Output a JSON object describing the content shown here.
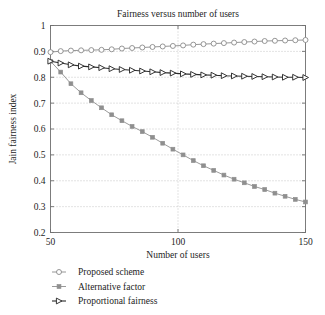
{
  "chart_data": {
    "type": "line",
    "title": "Fairness versus number of users",
    "xlabel": "Number of users",
    "ylabel": "Jain fairness index",
    "xlim": [
      50,
      150
    ],
    "ylim": [
      0.2,
      1
    ],
    "xticks": [
      50,
      100,
      150
    ],
    "xticklabels": [
      "50",
      "100",
      "150"
    ],
    "yticks": [
      0.2,
      0.3,
      0.4,
      0.5,
      0.6,
      0.7,
      0.8,
      0.9,
      1
    ],
    "yticklabels": [
      "0.2",
      "0.3",
      "0.4",
      "0.5",
      "0.6",
      "0.7",
      "0.8",
      "0.9",
      "1"
    ],
    "grid": "dotted",
    "legend_position": "below-left",
    "x": [
      50,
      54,
      58,
      62,
      66,
      70,
      74,
      78,
      82,
      86,
      90,
      94,
      98,
      102,
      106,
      110,
      114,
      118,
      122,
      126,
      130,
      134,
      138,
      142,
      146,
      150
    ],
    "series": [
      {
        "name": "Proposed scheme",
        "marker": "circle-open",
        "color": "#8a8a8a",
        "values": [
          0.897,
          0.901,
          0.903,
          0.904,
          0.905,
          0.906,
          0.908,
          0.911,
          0.913,
          0.915,
          0.917,
          0.919,
          0.921,
          0.923,
          0.926,
          0.928,
          0.93,
          0.932,
          0.934,
          0.936,
          0.938,
          0.94,
          0.941,
          0.942,
          0.943,
          0.944
        ]
      },
      {
        "name": "Alternative factor",
        "marker": "square-filled",
        "color": "#8f8f8f",
        "values": [
          0.862,
          0.82,
          0.775,
          0.74,
          0.71,
          0.682,
          0.655,
          0.632,
          0.61,
          0.59,
          0.568,
          0.545,
          0.522,
          0.5,
          0.478,
          0.458,
          0.44,
          0.422,
          0.406,
          0.392,
          0.378,
          0.366,
          0.352,
          0.34,
          0.328,
          0.318
        ]
      },
      {
        "name": "Proportional fairness",
        "marker": "triangle-right",
        "color": "#2b2b2b",
        "values": [
          0.862,
          0.855,
          0.848,
          0.843,
          0.84,
          0.837,
          0.833,
          0.83,
          0.827,
          0.824,
          0.821,
          0.818,
          0.816,
          0.813,
          0.811,
          0.809,
          0.808,
          0.806,
          0.805,
          0.804,
          0.803,
          0.802,
          0.801,
          0.8,
          0.8,
          0.799
        ]
      }
    ]
  },
  "legend": {
    "items": [
      {
        "label": "Proposed scheme"
      },
      {
        "label": "Alternative factor"
      },
      {
        "label": "Proportional fairness"
      }
    ]
  },
  "colors": {
    "axis": "#6f6f6f",
    "grid": "#b9b9b9",
    "proposed": "#8a8a8a",
    "alternative": "#8f8f8f",
    "proportional": "#2b2b2b"
  }
}
